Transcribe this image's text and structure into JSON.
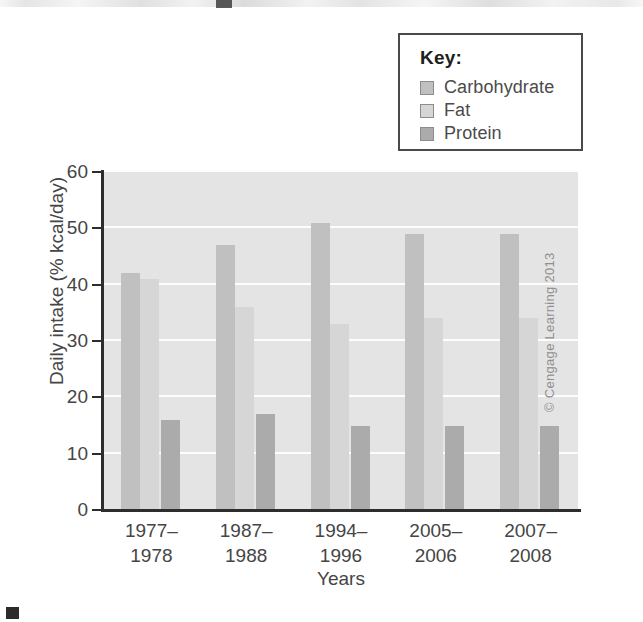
{
  "legend": {
    "title": "Key:",
    "entries": [
      {
        "label": "Carbohydrate",
        "color": "#c0c0c0",
        "icon": "legend-swatch-icon"
      },
      {
        "label": "Fat",
        "color": "#d6d6d6",
        "icon": "legend-swatch-icon"
      },
      {
        "label": "Protein",
        "color": "#ababab",
        "icon": "legend-swatch-icon"
      }
    ]
  },
  "credit": "© Cengage Learning 2013",
  "chart_data": {
    "type": "bar",
    "title": "",
    "xlabel": "Years",
    "ylabel": "Daily intake (% kcal/day)",
    "categories": [
      "1977–\n1978",
      "1987–\n1988",
      "1994–\n1996",
      "2005–\n2006",
      "2007–\n2008"
    ],
    "series": [
      {
        "name": "Carbohydrate",
        "color": "#c0c0c0",
        "values": [
          42,
          47,
          51,
          49,
          49
        ]
      },
      {
        "name": "Fat",
        "color": "#d6d6d6",
        "values": [
          41,
          36,
          33,
          34,
          34
        ]
      },
      {
        "name": "Protein",
        "color": "#ababab",
        "values": [
          16,
          17,
          15,
          15,
          15
        ]
      }
    ],
    "ylim": [
      0,
      60
    ],
    "yticks": [
      0,
      10,
      20,
      30,
      40,
      50,
      60
    ],
    "ytick_labels": [
      "0",
      "10",
      "20",
      "30",
      "40",
      "50",
      "60"
    ],
    "grid": true,
    "grid_color": "#fdfdfd",
    "plot_background": "#e4e4e4",
    "axis_color": "#2d2d2d",
    "legend_position": "top-right-outside"
  }
}
